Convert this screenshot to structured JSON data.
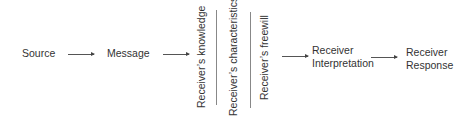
{
  "diagram": {
    "nodes": [
      {
        "id": "source",
        "label": "Source"
      },
      {
        "id": "message",
        "label": "Message"
      },
      {
        "id": "knowledge",
        "label": "Receiver’s knowledge"
      },
      {
        "id": "characteristics",
        "label": "Receiver’s characteristics"
      },
      {
        "id": "freewill",
        "label": "Receiver’s freewill"
      },
      {
        "id": "interpretation",
        "line1": "Receiver",
        "line2": "Interpretation"
      },
      {
        "id": "response",
        "line1": "Receiver",
        "line2": "Response"
      }
    ],
    "edges": [
      {
        "from": "source",
        "to": "message"
      },
      {
        "from": "message",
        "to": "receiver-filters"
      },
      {
        "from": "receiver-filters",
        "to": "interpretation"
      },
      {
        "from": "interpretation",
        "to": "response"
      }
    ]
  }
}
